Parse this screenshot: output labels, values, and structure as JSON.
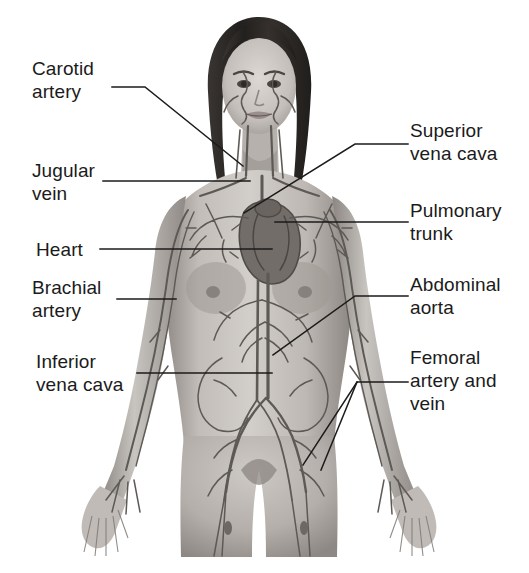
{
  "diagram": {
    "style": "grayscale medical illustration",
    "colors": {
      "background": "#ffffff",
      "text": "#1b1b1b",
      "leader_line": "#1b1b1b",
      "skin_light": "#cfcbc6",
      "skin_mid": "#a8a39d",
      "skin_dark": "#807b76",
      "hair": "#2f2b29",
      "vessel": "#5d5955",
      "heart": "#6b6561"
    },
    "labels_left": [
      {
        "id": "carotid-artery",
        "text": "Carotid\nartery",
        "x": 32,
        "y": 57
      },
      {
        "id": "jugular-vein",
        "text": "Jugular\nvein",
        "x": 32,
        "y": 159
      },
      {
        "id": "heart",
        "text": "Heart",
        "x": 36,
        "y": 238
      },
      {
        "id": "brachial-artery",
        "text": "Brachial\nartery",
        "x": 32,
        "y": 276
      },
      {
        "id": "inferior-vena-cava",
        "text": "Inferior\nvena cava",
        "x": 36,
        "y": 350
      }
    ],
    "labels_right": [
      {
        "id": "superior-vena-cava",
        "text": "Superior\nvena cava",
        "x": 410,
        "y": 119
      },
      {
        "id": "pulmonary-trunk",
        "text": "Pulmonary\ntrunk",
        "x": 410,
        "y": 199
      },
      {
        "id": "abdominal-aorta",
        "text": "Abdominal\naorta",
        "x": 410,
        "y": 273
      },
      {
        "id": "femoral-artery-vein",
        "text": "Femoral\nartery and\nvein",
        "x": 410,
        "y": 346
      }
    ],
    "leader_lines": [
      {
        "id": "leader-carotid-artery",
        "points": "112,87 145,87 243,166"
      },
      {
        "id": "leader-jugular-vein",
        "points": "103,181 250,181"
      },
      {
        "id": "leader-heart",
        "points": "100,249 272,249"
      },
      {
        "id": "leader-brachial-artery",
        "points": "117,299 176,299"
      },
      {
        "id": "leader-inferior-vena-cava",
        "points": "137,373 272,373"
      },
      {
        "id": "leader-superior-vena-cava",
        "points": "408,144 355,144 244,213"
      },
      {
        "id": "leader-pulmonary-trunk",
        "points": "408,222 275,222"
      },
      {
        "id": "leader-abdominal-aorta",
        "points": "408,296 355,296 273,355"
      },
      {
        "id": "leader-femoral-1",
        "points": "408,382 357,382 303,465"
      },
      {
        "id": "leader-femoral-2",
        "points": "357,382 321,470"
      }
    ]
  }
}
